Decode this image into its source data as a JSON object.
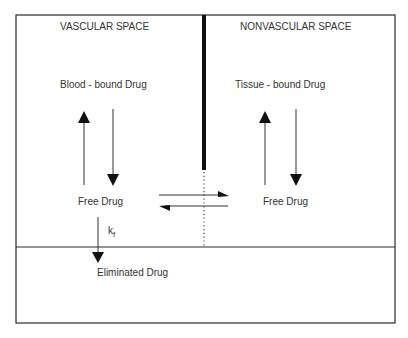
{
  "diagram": {
    "compartments": {
      "vascular": {
        "title": "VASCULAR SPACE",
        "bound_label": "Blood - bound Drug",
        "free_label": "Free Drug"
      },
      "nonvascular": {
        "title": "NONVASCULAR SPACE",
        "bound_label": "Tissue - bound Drug",
        "free_label": "Free Drug"
      },
      "elimination": {
        "label": "Eliminated Drug"
      }
    },
    "rate_constant": {
      "symbol": "k",
      "subscript": "f"
    },
    "colors": {
      "line": "#2a2a2a",
      "background": "#ffffff"
    }
  }
}
